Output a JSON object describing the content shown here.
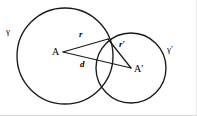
{
  "figure": {
    "background_color": "#ffffff",
    "stroke_color": "#1a1a1a",
    "canvas": {
      "width": 197,
      "height": 116
    },
    "circles": [
      {
        "name": "gamma",
        "label": "γ",
        "center_label": "A",
        "cx": 65,
        "cy": 56,
        "r": 48,
        "label_x": 6,
        "label_y": 27
      },
      {
        "name": "gamma-prime",
        "label": "γ′",
        "center_label": "A′",
        "cx": 131,
        "cy": 68,
        "r": 35,
        "label_x": 167,
        "label_y": 45
      }
    ],
    "points": [
      {
        "name": "center-A",
        "label": "A",
        "x": 63,
        "y": 52
      },
      {
        "name": "center-Ap",
        "label": "A′",
        "x": 131,
        "y": 68
      },
      {
        "name": "intersection-upper",
        "label": "",
        "x": 108,
        "y": 39
      }
    ],
    "segments": [
      {
        "name": "radius-r",
        "label": "r",
        "from": "center-A",
        "to": "intersection-upper",
        "label_x": 79,
        "label_y": 30
      },
      {
        "name": "radius-r-prime",
        "label": "r′",
        "from": "center-Ap",
        "to": "intersection-upper",
        "label_x": 119,
        "label_y": 40
      },
      {
        "name": "distance-d",
        "label": "d",
        "from": "center-A",
        "to": "center-Ap",
        "label_x": 80,
        "label_y": 60
      }
    ]
  }
}
